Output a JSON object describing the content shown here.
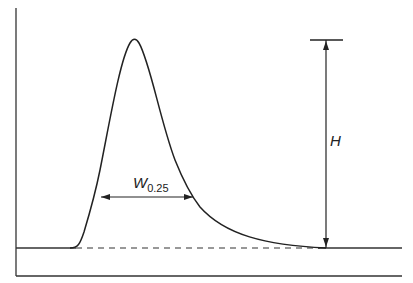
{
  "diagram": {
    "labels": {
      "width_main": "W",
      "width_sub": "0.25",
      "height": "H"
    },
    "colors": {
      "line": "#222222",
      "background": "#ffffff"
    }
  }
}
